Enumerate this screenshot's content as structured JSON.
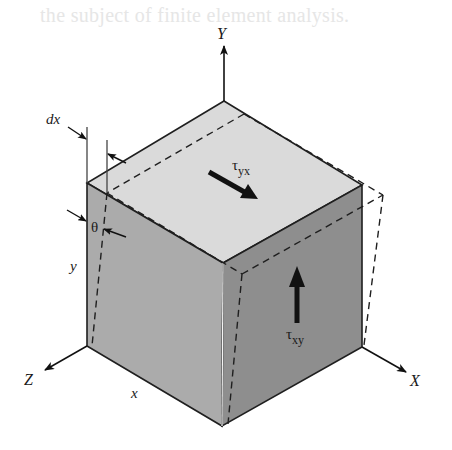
{
  "background_text": "the subject of finite element analysis.",
  "axes": {
    "y_label": "Y",
    "x_label": "X",
    "z_label": "Z"
  },
  "dimensions": {
    "dx_label": "dx",
    "theta_label": "θ",
    "y_label": "y",
    "x_label": "x"
  },
  "stresses": {
    "tau_yx": {
      "symbol": "τ",
      "subscript": "yx",
      "direction": "down-right, on top face"
    },
    "tau_xy": {
      "symbol": "τ",
      "subscript": "xy",
      "direction": "up, on right face"
    }
  },
  "colors": {
    "top_face": "#d9d9d9",
    "left_face": "#a9a9a9",
    "right_face": "#8c8c8c",
    "edge": "#1f1f1f",
    "arrow": "#111111"
  }
}
